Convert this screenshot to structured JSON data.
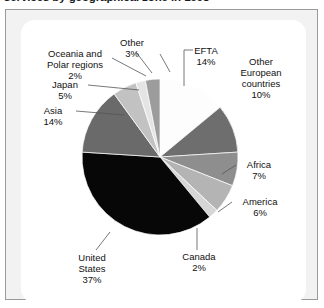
{
  "title": "services by geographical zone in 1998",
  "chart_data": {
    "type": "pie",
    "title": "services by geographical zone in 1998",
    "xlabel": "",
    "ylabel": "",
    "legend_position": "none",
    "grid": false,
    "units": "percent",
    "start_angle_deg": 0,
    "direction": "clockwise",
    "categories": [
      "EFTA",
      "Other European countries",
      "Africa",
      "America",
      "Canada",
      "United States",
      "Asia",
      "Japan",
      "Oceania and Polar regions",
      "Other"
    ],
    "values": [
      14,
      10,
      7,
      6,
      2,
      37,
      14,
      5,
      2,
      3
    ],
    "value_labels": [
      "14%",
      "10%",
      "7%",
      "6%",
      "2%",
      "37%",
      "14%",
      "5%",
      "2%",
      "3%"
    ],
    "colors": [
      "#fdfdfd",
      "#6e6e6e",
      "#8e8e8e",
      "#b4b4b4",
      "#d6d6d6",
      "#070707",
      "#6a6a6a",
      "#c2c2c2",
      "#e4e4e4",
      "#9c9c9c"
    ],
    "total": 100
  },
  "labels": {
    "efta": {
      "name": "EFTA",
      "value": "14%"
    },
    "othereuro": {
      "name": "Other European countries",
      "value": "10%"
    },
    "africa": {
      "name": "Africa",
      "value": "7%"
    },
    "america": {
      "name": "America",
      "value": "6%"
    },
    "canada": {
      "name": "Canada",
      "value": "2%"
    },
    "unitedstates": {
      "name": "United States",
      "value": "37%"
    },
    "asia": {
      "name": "Asia",
      "value": "14%"
    },
    "japan": {
      "name": "Japan",
      "value": "5%"
    },
    "oceania": {
      "name": "Oceania and Polar regions",
      "value": "2%"
    },
    "other": {
      "name": "Other",
      "value": "3%"
    }
  }
}
